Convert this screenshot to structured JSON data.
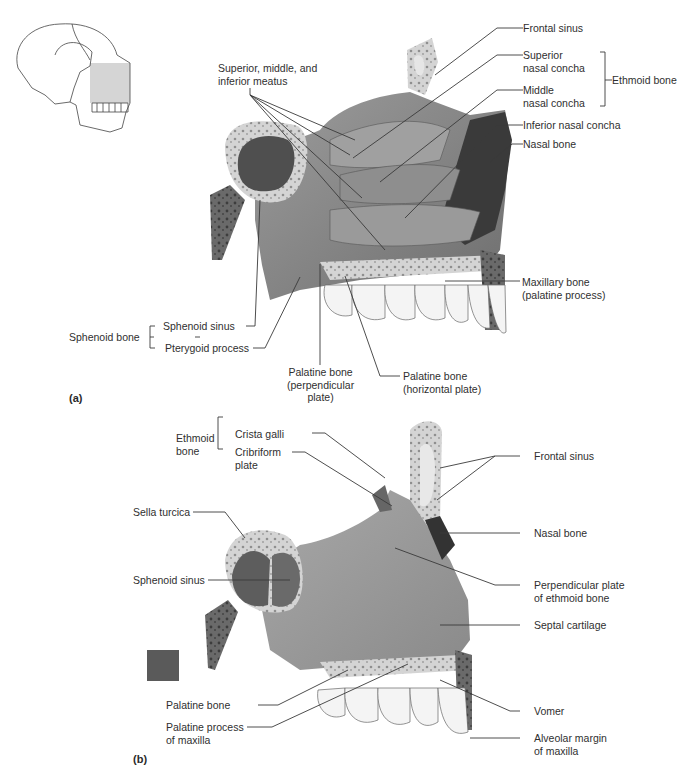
{
  "figure_a": {
    "panel_label": "(a)",
    "labels": {
      "meatus": "Superior, middle, and\ninferior meatus",
      "frontal_sinus": "Frontal sinus",
      "superior_concha": "Superior\nnasal concha",
      "middle_concha": "Middle\nnasal concha",
      "ethmoid_bone": "Ethmoid bone",
      "inferior_concha": "Inferior nasal concha",
      "nasal_bone": "Nasal bone",
      "maxillary_bone": "Maxillary bone\n(palatine process)",
      "sphenoid_bone": "Sphenoid bone",
      "sphenoid_sinus": "Sphenoid sinus",
      "pterygoid_process": "Pterygoid process",
      "palatine_perpendicular": "Palatine bone\n(perpendicular\nplate)",
      "palatine_horizontal": "Palatine bone\n(horizontal plate)"
    }
  },
  "figure_b": {
    "panel_label": "(b)",
    "labels": {
      "ethmoid_bone": "Ethmoid\nbone",
      "crista_galli": "Crista galli",
      "cribriform_plate": "Cribriform\nplate",
      "frontal_sinus": "Frontal sinus",
      "sella_turcica": "Sella turcica",
      "nasal_bone": "Nasal bone",
      "sphenoid_sinus": "Sphenoid sinus",
      "perpendicular_plate": "Perpendicular plate\nof ethmoid bone",
      "septal_cartilage": "Septal cartilage",
      "palatine_bone": "Palatine bone",
      "vomer": "Vomer",
      "palatine_process": "Palatine process\nof maxilla",
      "alveolar_margin": "Alveolar margin\nof maxilla"
    }
  },
  "colors": {
    "bone_light": "#d9d9d9",
    "tissue_mid": "#8a8a8a",
    "tissue_dark": "#4d4d4d",
    "leader_line": "#3a3a3a",
    "swatch": "#5a5a5a"
  }
}
